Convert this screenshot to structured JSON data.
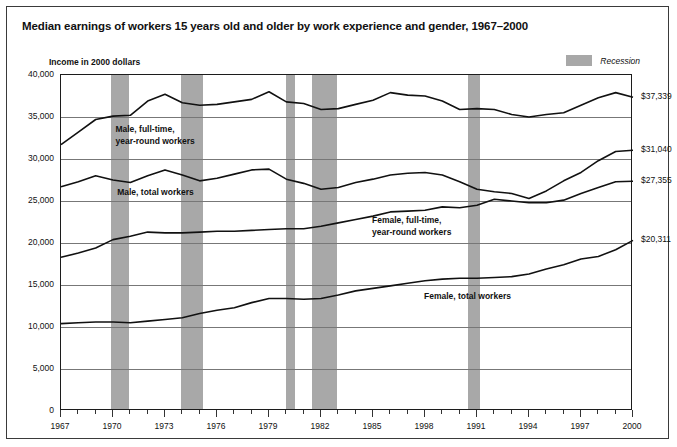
{
  "header": {
    "title": "Median earnings of workers 15 years old and older by work experience and gender, 1967–2000",
    "subtitle": "Income in 2000 dollars"
  },
  "legend": {
    "recession_label": "Recession",
    "recession_color": "#a8a8a8"
  },
  "annotations": {
    "male_fulltime_line1": "Male, full-time,",
    "male_fulltime_line2": "year-round workers",
    "male_total": "Male, total workers",
    "female_fulltime_line1": "Female, full-time,",
    "female_fulltime_line2": "year-round workers",
    "female_total": "Female, total workers"
  },
  "end_labels": {
    "male_fulltime": "$37,339",
    "male_total": "$31,040",
    "female_fulltime": "$27,355",
    "female_total": "$20,311"
  },
  "chart_data": {
    "type": "line",
    "title": "Median earnings of workers 15 years old and older by work experience and gender, 1967–2000",
    "subtitle": "Income in 2000 dollars",
    "xlabel": "",
    "ylabel": "Income in 2000 dollars",
    "xlim": [
      1967,
      2000
    ],
    "ylim": [
      0,
      40000
    ],
    "yticks": [
      0,
      5000,
      10000,
      15000,
      20000,
      25000,
      30000,
      35000,
      40000
    ],
    "ytick_labels": [
      "0",
      "5,000",
      "10,000",
      "15,000",
      "20,000",
      "25,000",
      "30,000",
      "35,000",
      "40,000"
    ],
    "xticks": [
      1967,
      1970,
      1973,
      1976,
      1979,
      1982,
      1985,
      1988,
      1991,
      1994,
      1997,
      2000
    ],
    "xtick_labels": [
      "1967",
      "1970",
      "1973",
      "1976",
      "1979",
      "1982",
      "1985",
      "1998",
      "1991",
      "1994",
      "1997",
      "2000"
    ],
    "grid": "horizontal",
    "legend_position": "top-right",
    "x": [
      1967,
      1968,
      1969,
      1970,
      1971,
      1972,
      1973,
      1974,
      1975,
      1976,
      1977,
      1978,
      1979,
      1980,
      1981,
      1982,
      1983,
      1984,
      1985,
      1986,
      1987,
      1988,
      1989,
      1990,
      1991,
      1992,
      1993,
      1994,
      1995,
      1996,
      1997,
      1998,
      1999,
      2000
    ],
    "series": [
      {
        "name": "Male, full-time, year-round workers",
        "color": "#111111",
        "end_value": 37339,
        "values": [
          31700,
          33200,
          34700,
          35100,
          35200,
          36900,
          37700,
          36700,
          36400,
          36500,
          36800,
          37100,
          38000,
          36800,
          36600,
          35900,
          36000,
          36500,
          37000,
          37900,
          37600,
          37500,
          36900,
          35900,
          36000,
          35900,
          35300,
          35000,
          35300,
          35500,
          36400,
          37300,
          37900,
          37339
        ]
      },
      {
        "name": "Male, total workers",
        "color": "#111111",
        "end_value": 31040,
        "values": [
          26700,
          27300,
          28000,
          27500,
          27200,
          28000,
          28700,
          28100,
          27400,
          27700,
          28200,
          28700,
          28800,
          27600,
          27100,
          26400,
          26600,
          27200,
          27600,
          28100,
          28300,
          28400,
          28100,
          27300,
          26400,
          26100,
          25900,
          25300,
          26200,
          27400,
          28400,
          29800,
          30900,
          31040
        ]
      },
      {
        "name": "Female, full-time, year-round workers",
        "color": "#111111",
        "end_value": 27355,
        "values": [
          18300,
          18800,
          19400,
          20400,
          20800,
          21300,
          21200,
          21200,
          21300,
          21400,
          21400,
          21500,
          21600,
          21700,
          21700,
          22000,
          22400,
          22800,
          23200,
          23700,
          23800,
          23900,
          24300,
          24200,
          24500,
          25200,
          25000,
          24800,
          24800,
          25100,
          25900,
          26600,
          27300,
          27355
        ]
      },
      {
        "name": "Female, total workers",
        "color": "#111111",
        "end_value": 20311,
        "values": [
          10400,
          10500,
          10600,
          10600,
          10500,
          10700,
          10900,
          11100,
          11600,
          12000,
          12300,
          12900,
          13400,
          13400,
          13300,
          13400,
          13800,
          14300,
          14600,
          14900,
          15200,
          15500,
          15700,
          15800,
          15800,
          15900,
          16000,
          16300,
          16900,
          17400,
          18100,
          18400,
          19200,
          20311
        ]
      }
    ],
    "recession_bands": [
      {
        "start": 1969.9,
        "end": 1970.9
      },
      {
        "start": 1973.9,
        "end": 1975.2
      },
      {
        "start": 1980.0,
        "end": 1980.5
      },
      {
        "start": 1981.5,
        "end": 1982.9
      },
      {
        "start": 1990.5,
        "end": 1991.2
      }
    ]
  }
}
